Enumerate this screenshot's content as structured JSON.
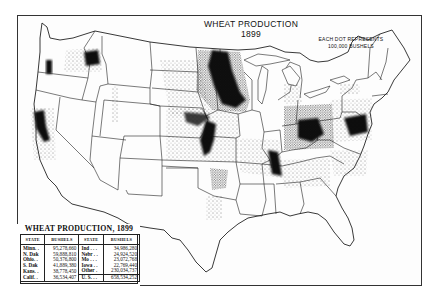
{
  "map": {
    "title": "WHEAT PRODUCTION",
    "year": "1899",
    "dot_note_line1": "EACH DOT REPRESENTS",
    "dot_note_line2": "100,000 BUSHELS",
    "dot_value_bushels": 100000,
    "colors": {
      "ink": "#111111",
      "paper": "#fdfdfd",
      "border": "#333333"
    }
  },
  "legend": {
    "title": "WHEAT PRODUCTION, 1899",
    "headers": [
      "STATE",
      "BUSHELS",
      "STATE",
      "BUSHELS"
    ],
    "left_rows": [
      {
        "state": "Minn. .",
        "bushels": "95,278,660"
      },
      {
        "state": "N. Dak",
        "bushels": "59,888,810"
      },
      {
        "state": "Ohio. .",
        "bushels": "50,376,800"
      },
      {
        "state": "S. Dak",
        "bushels": "41,889,380"
      },
      {
        "state": "Kans. .",
        "bushels": "38,778,450"
      },
      {
        "state": "Calif. .",
        "bushels": "36,534,407"
      }
    ],
    "right_rows": [
      {
        "state": "Ind . . .",
        "bushels": "34,986,280"
      },
      {
        "state": "Nebr . .",
        "bushels": "24,924,520"
      },
      {
        "state": "Mo . . .",
        "bushels": "23,072,768"
      },
      {
        "state": "Iowa . .",
        "bushels": "22,769,440"
      },
      {
        "state": "Other .",
        "bushels": "230,034,737"
      }
    ],
    "total": {
      "state": "U. S. . .",
      "bushels": "658,534,252"
    }
  }
}
